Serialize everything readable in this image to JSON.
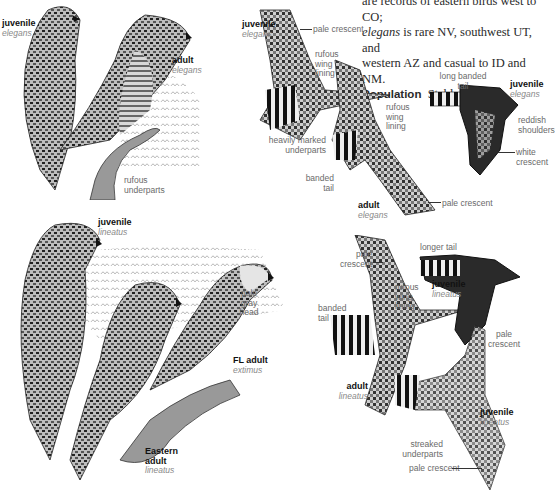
{
  "text_block": {
    "line1": "are records of eastern birds west to CO;",
    "line2_italic": "elegans",
    "line2_rest": " is rare NV, southwest UT, and",
    "line3": "western AZ and casual to ID and NM.",
    "population_heading": "Population",
    "population_value": "Stable."
  },
  "panels": {
    "perched_elegans": {
      "juvenile": {
        "age": "juvenile",
        "subspecies": "elegans"
      },
      "adult": {
        "age": "adult",
        "subspecies": "elegans"
      },
      "feature_underparts": "rufous underparts"
    },
    "flight_elegans": {
      "juvenile": {
        "age": "juvenile",
        "subspecies": "elegans"
      },
      "feat_pale_crescent": "pale crescent",
      "feat_rufous_lining": "rufous wing lining",
      "feat_heavily_marked": "heavily marked underparts",
      "feat_banded_tail": "banded tail",
      "adult": {
        "age": "adult",
        "subspecies": "elegans"
      },
      "feat_rufous_lining_2": "rufous wing lining",
      "feat_pale_crescent_2": "pale crescent"
    },
    "flight_elegans_juv_dorsal": {
      "juvenile": {
        "age": "juvenile",
        "subspecies": "elegans"
      },
      "feat_long_tail": "long banded tail",
      "feat_reddish_shoulders": "reddish shoulders",
      "feat_white_crescent": "white crescent"
    },
    "perched_lineatus": {
      "juvenile": {
        "age": "juvenile",
        "subspecies": "lineatus"
      },
      "feat_pale_gray_head": "pale gray head",
      "fl_adult": {
        "age": "FL adult",
        "subspecies": "extimus"
      },
      "eastern_adult": {
        "age_line1": "Eastern",
        "age_line2": "adult",
        "subspecies": "lineatus"
      }
    },
    "flight_lineatus": {
      "feat_pale_crescent": "pale crescent",
      "feat_rufous_lining": "rufous wing lining",
      "feat_banded_tail": "banded tail",
      "adult": {
        "age": "adult",
        "subspecies": "lineatus"
      },
      "feat_longer_tail": "longer tail",
      "juvenile_dorsal": {
        "age": "juvenile",
        "subspecies": "lineatus"
      },
      "feat_pale_crescent_dorsal": "pale crescent",
      "juvenile_ventral": {
        "age": "juvenile",
        "subspecies": "lineatus"
      },
      "feat_streaked": "streaked underparts",
      "feat_pale_crescent_ventral": "pale crescent"
    }
  },
  "colors": {
    "ink": "#111111",
    "label_gray": "#666666",
    "subspecies_gray": "#8a8a8a",
    "background": "#ffffff"
  }
}
